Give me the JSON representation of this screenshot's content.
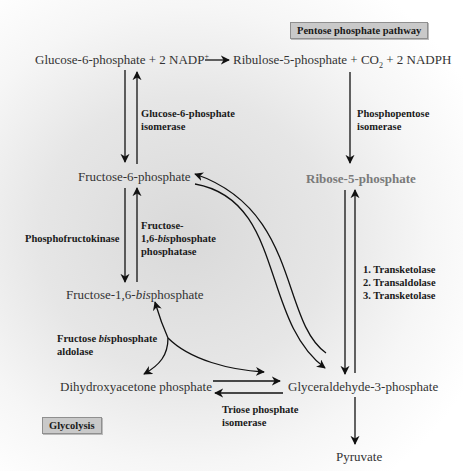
{
  "pathway_labels": {
    "pentose": "Pentose phosphate pathway",
    "glycolysis": "Glycolysis"
  },
  "molecules": {
    "glucose6p": "Glucose-6-phosphate + 2 NADP",
    "glucose6p_sup": "+",
    "ribulose5p_a": "Ribulose-5-phosphate + CO",
    "ribulose5p_sub": "2",
    "ribulose5p_b": " + 2 NADPH",
    "fructose6p": "Fructose-6-phosphate",
    "ribose5p": "Ribose-5-phosphate",
    "fructose16bp_a": "Fructose-1,6-",
    "fructose16bp_it": "bis",
    "fructose16bp_b": "phosphate",
    "dhap": "Dihydroxyacetone phosphate",
    "g3p": "Glyceraldehyde-3-phosphate",
    "pyruvate": "Pyruvate"
  },
  "enzymes": {
    "g6p_isomerase_1": "Glucose-6-phosphate",
    "g6p_isomerase_2": "isomerase",
    "phosphopentose_1": "Phosphopentose",
    "phosphopentose_2": "isomerase",
    "pfk": "Phosphofructokinase",
    "fbpase_1": "Fructose-",
    "fbpase_2a": "1,6-",
    "fbpase_2it": "bis",
    "fbpase_2b": "phosphate",
    "fbpase_3": "phosphatase",
    "transketolase_1": "1. Transketolase",
    "transaldolase_2": "2. Transaldolase",
    "transketolase_3": "3. Transketolase",
    "aldolase_1a": "Fructose ",
    "aldolase_1it": "bis",
    "aldolase_1b": "phosphate",
    "aldolase_2": "aldolase",
    "tpi_1": "Triose phosphate",
    "tpi_2": "isomerase"
  }
}
